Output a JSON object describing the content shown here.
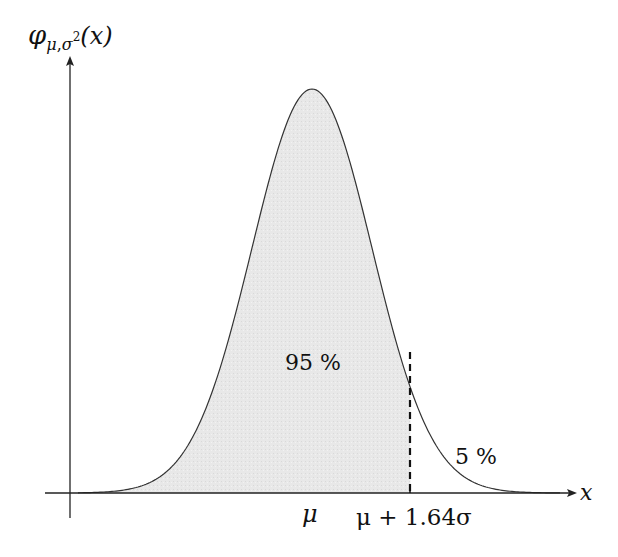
{
  "diagram": {
    "type": "normal-distribution-one-sided-interval",
    "y_axis_label": {
      "func": "φ",
      "sub_mu": "μ",
      "sub_comma": ",",
      "sub_sigma": "σ",
      "sub_sup": "2",
      "arg": "(x)"
    },
    "x_axis_label": "x",
    "tick_labels": {
      "mean": "μ",
      "cutoff": "μ + 1.64σ"
    },
    "region_labels": {
      "inside": "95 %",
      "tail": "5 %"
    },
    "parameters": {
      "mean_px": 312,
      "sigma_px": 60,
      "cutoff_z": 1.64,
      "peak_y_px": 89,
      "baseline_y_px": 493
    },
    "colors": {
      "fill": "#e6e6e6",
      "curve": "#333333",
      "axis": "#222222"
    }
  }
}
